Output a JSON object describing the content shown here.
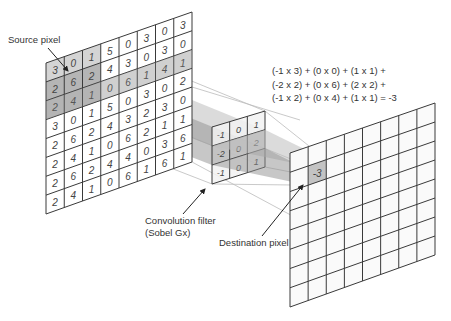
{
  "labels": {
    "source_pixel": "Source pixel",
    "filter_line1": "Convolution filter",
    "filter_line2": "(Sobel Gx)",
    "destination_pixel": "Destination pixel"
  },
  "formula": {
    "line1": "(-1 x 3) + (0 x 0) + (1 x 1) +",
    "line2": "(-2 x 2) + (0 x 6) + (2 x 2) +",
    "line3": "(-1 x 2) + (0 x 4) + (1 x 1)  = -3"
  },
  "source_grid": {
    "rows": 8,
    "cols": 8,
    "values": [
      [
        "3",
        "0",
        "1",
        "5",
        "0",
        "3",
        "0",
        "3"
      ],
      [
        "2",
        "6",
        "2",
        "4",
        "3",
        "0",
        "3",
        "0"
      ],
      [
        "2",
        "4",
        "1",
        "0",
        "6",
        "1",
        "4",
        "1"
      ],
      [
        "3",
        "0",
        "1",
        "5",
        "0",
        "3",
        "0",
        "2"
      ],
      [
        "2",
        "6",
        "2",
        "4",
        "3",
        "2",
        "3",
        "0"
      ],
      [
        "2",
        "4",
        "1",
        "0",
        "6",
        "2",
        "1",
        "1"
      ],
      [
        "2",
        "6",
        "2",
        "4",
        "4",
        "0",
        "3",
        "6"
      ],
      [
        "2",
        "4",
        "1",
        "0",
        "6",
        "1",
        "6",
        "1"
      ]
    ],
    "corners": {
      "tl": [
        46,
        63
      ],
      "tr": [
        192,
        12
      ],
      "bl": [
        46,
        214
      ],
      "br": [
        192,
        162
      ]
    }
  },
  "filter_grid": {
    "rows": 3,
    "cols": 3,
    "values": [
      [
        "-1",
        "0",
        "1"
      ],
      [
        "-2",
        "0",
        "2"
      ],
      [
        "-1",
        "0",
        "1"
      ]
    ],
    "corners": {
      "tl": [
        212,
        127
      ],
      "tr": [
        265,
        111
      ],
      "bl": [
        212,
        184
      ],
      "br": [
        265,
        167
      ]
    }
  },
  "destination_grid": {
    "rows": 8,
    "cols": 8,
    "highlight_cell": {
      "row": 1,
      "col": 1,
      "value": "-3"
    },
    "corners": {
      "tl": [
        290,
        153
      ],
      "tr": [
        435,
        103
      ],
      "bl": [
        290,
        307
      ],
      "br": [
        435,
        255
      ]
    }
  },
  "colors": {
    "line": "#3a3a3a",
    "text": "#444444",
    "window_fill": "#cfcfcf",
    "beam_light": "#bdbdbd",
    "beam_dark": "#8f8f8f",
    "guide": "#bbbbbb"
  }
}
